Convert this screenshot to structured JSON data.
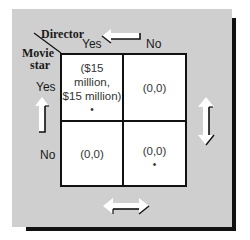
{
  "header": {
    "column_player": "Director",
    "row_player_line1": "Movie",
    "row_player_line2": "star"
  },
  "columns": [
    {
      "label": "Yes"
    },
    {
      "label": "No"
    }
  ],
  "rows": [
    {
      "label": "Yes"
    },
    {
      "label": "No"
    }
  ],
  "cells": [
    [
      {
        "payoff_line1": "($15 million,",
        "payoff_line2": "$15 million)",
        "equilibrium_marker": "•"
      },
      {
        "payoff_line1": "(0,0)",
        "payoff_line2": "",
        "equilibrium_marker": ""
      }
    ],
    [
      {
        "payoff_line1": "(0,0)",
        "payoff_line2": "",
        "equilibrium_marker": ""
      },
      {
        "payoff_line1": "(0,0)",
        "payoff_line2": "",
        "equilibrium_marker": "•"
      }
    ]
  ],
  "arrows": {
    "top": "left-arrow",
    "left": "up-arrow",
    "right": "up-down-arrow",
    "bottom": "left-right-arrow"
  },
  "colors": {
    "panel": "#cfcfcf",
    "shadow": "#111111",
    "cell": "#ffffff",
    "arrow_fill": "#ffffff",
    "arrow_stroke": "#111111"
  }
}
